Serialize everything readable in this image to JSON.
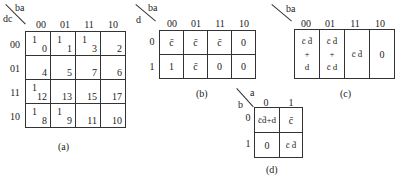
{
  "maps": {
    "a": {
      "caption": "(a)",
      "col_var": "ba",
      "row_var": "dc",
      "cols": [
        "00",
        "01",
        "11",
        "10"
      ],
      "rows": [
        "00",
        "01",
        "11",
        "10"
      ],
      "cells": [
        [
          {
            "v": "1",
            "n": "0"
          },
          {
            "v": "1",
            "n": "1"
          },
          {
            "v": "1",
            "n": "3"
          },
          {
            "v": "",
            "n": "2"
          }
        ],
        [
          {
            "v": "",
            "n": "4"
          },
          {
            "v": "",
            "n": "5"
          },
          {
            "v": "",
            "n": "7"
          },
          {
            "v": "",
            "n": "6"
          }
        ],
        [
          {
            "v": "1",
            "n": "12"
          },
          {
            "v": "",
            "n": "13"
          },
          {
            "v": "",
            "n": "15"
          },
          {
            "v": "",
            "n": "17"
          }
        ],
        [
          {
            "v": "1",
            "n": "8"
          },
          {
            "v": "1",
            "n": "9"
          },
          {
            "v": "",
            "n": "11"
          },
          {
            "v": "",
            "n": "10"
          }
        ]
      ]
    },
    "b": {
      "caption": "(b)",
      "col_var": "ba",
      "row_var": "d",
      "cols": [
        "00",
        "01",
        "11",
        "10"
      ],
      "rows": [
        "0",
        "1"
      ],
      "cells": [
        [
          "c̄",
          "c̄",
          "c̄",
          "0"
        ],
        [
          "1",
          "c̄",
          "0",
          "0"
        ]
      ]
    },
    "c": {
      "caption": "(c)",
      "col_var": "ba",
      "cols": [
        "00",
        "01",
        "11",
        "10"
      ],
      "cells": [
        {
          "top": "c̄ d̄",
          "mid": "+",
          "bot": "d"
        },
        {
          "top": "c̄ d̄",
          "mid": "+",
          "bot": "c̄ d"
        },
        {
          "top": "c̄ d̄",
          "mid": "",
          "bot": ""
        },
        {
          "top": "0",
          "mid": "",
          "bot": ""
        }
      ]
    },
    "d": {
      "caption": "(d)",
      "col_var": "a",
      "row_var": "b",
      "cols": [
        "0",
        "1"
      ],
      "rows": [
        "0",
        "1"
      ],
      "cells": [
        [
          "c̄d̄+d",
          "c̄"
        ],
        [
          "0",
          "c̄ d̄"
        ]
      ]
    }
  }
}
